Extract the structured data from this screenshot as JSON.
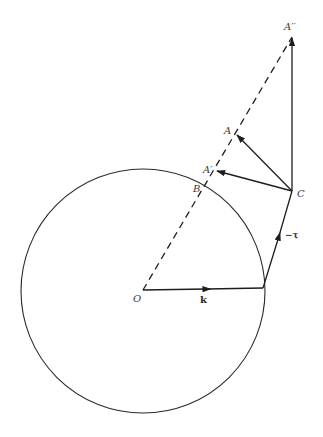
{
  "figure": {
    "type": "geometric vector diagram",
    "circle": {
      "center_label": "O",
      "cx": 143,
      "cy": 291,
      "r": 122
    },
    "points": {
      "O": {
        "label": "O",
        "x": 143,
        "y": 290
      },
      "P": {
        "label": "",
        "x": 263,
        "y": 288
      },
      "C": {
        "label": "C",
        "x": 292,
        "y": 191
      },
      "A2": {
        "label": "A′′",
        "x": 292,
        "y": 37
      },
      "A": {
        "label": "A",
        "x": 236,
        "y": 134
      },
      "A1": {
        "label": "A′",
        "x": 216,
        "y": 171
      },
      "B": {
        "label": "B",
        "x": 206,
        "y": 186
      }
    },
    "labels": {
      "O": "O",
      "k": "k",
      "tau": "−τ",
      "C": "C",
      "A": "A",
      "A_prime": "A′",
      "A_double_prime": "A′′",
      "B": "B"
    },
    "vectors": [
      {
        "name": "k",
        "from": "O",
        "to": "P",
        "label": "k"
      },
      {
        "name": "-tau",
        "from": "P",
        "to": "C",
        "label": "−τ"
      },
      {
        "name": "CA",
        "from": "C",
        "to": "A"
      },
      {
        "name": "CA'",
        "from": "C",
        "to": "A1"
      },
      {
        "name": "CA''",
        "from": "C",
        "to": "A2"
      }
    ],
    "dashed_line": {
      "from": "O",
      "to": "A2",
      "passes_through": [
        "B",
        "A1",
        "A"
      ]
    },
    "colors": {
      "ink": "#1e1e1e",
      "label": "#3a3a3a",
      "background": "#ffffff"
    }
  }
}
